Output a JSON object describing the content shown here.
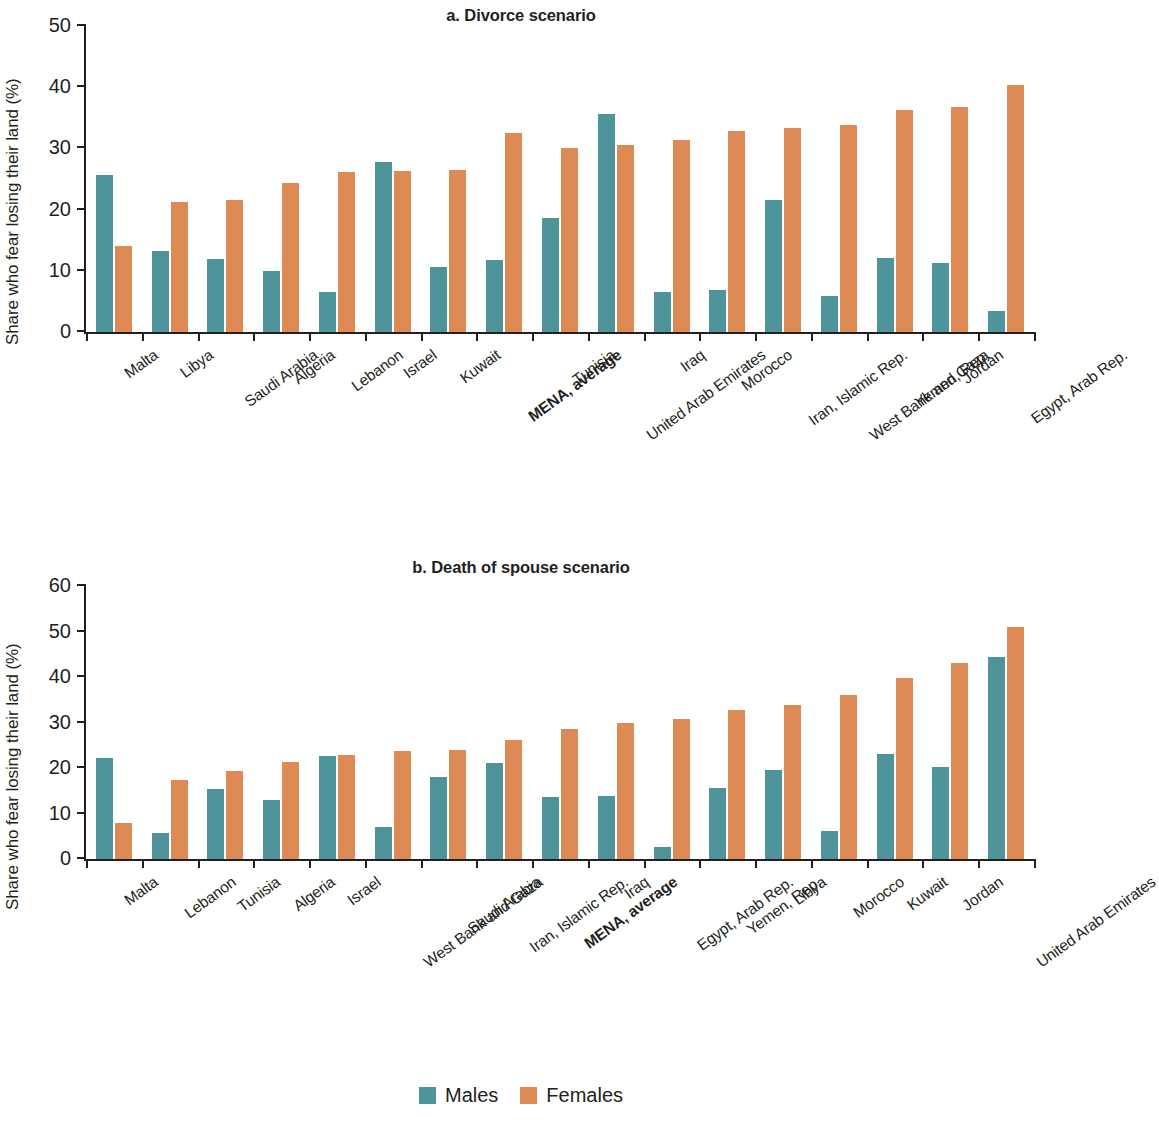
{
  "figure": {
    "legend": {
      "items": [
        {
          "label": "Males",
          "color": "#4f949b",
          "key": "males"
        },
        {
          "label": "Females",
          "color": "#dd8a55",
          "key": "females"
        }
      ]
    }
  },
  "chart_data": [
    {
      "type": "bar",
      "panel": "a",
      "title": "a. Divorce scenario",
      "xlabel": "",
      "ylabel": "Share who fear losing their land (%)",
      "ylim": [
        0,
        50
      ],
      "yticks": [
        0,
        10,
        20,
        30,
        40,
        50
      ],
      "grid": false,
      "legend_position": "bottom-center",
      "highlight_category": "MENA, average",
      "categories": [
        "Malta",
        "Libya",
        "Saudi Arabia",
        "Algeria",
        "Lebanon",
        "Israel",
        "Kuwait",
        "MENA, average",
        "Tunisia",
        "United Arab Emirates",
        "Iraq",
        "Morocco",
        "Iran, Islamic Rep.",
        "West Bank and Gaza",
        "Yemen, Rep.",
        "Jordan",
        "Egypt, Arab Rep."
      ],
      "series": [
        {
          "name": "Males",
          "color": "#4f949b",
          "values": [
            25.6,
            13.2,
            11.9,
            9.9,
            6.5,
            27.8,
            10.6,
            11.8,
            18.6,
            35.6,
            6.5,
            6.8,
            21.5,
            5.9,
            12.1,
            11.2,
            3.4
          ]
        },
        {
          "name": "Females",
          "color": "#dd8a55",
          "values": [
            14.1,
            21.2,
            21.5,
            24.3,
            26.1,
            26.3,
            26.4,
            32.6,
            30.1,
            30.5,
            31.4,
            32.9,
            33.4,
            33.8,
            36.3,
            36.7,
            40.3
          ]
        }
      ]
    },
    {
      "type": "bar",
      "panel": "b",
      "title": "b. Death of spouse scenario",
      "xlabel": "",
      "ylabel": "Share who fear losing their land (%)",
      "ylim": [
        0,
        60
      ],
      "yticks": [
        0,
        10,
        20,
        30,
        40,
        50,
        60
      ],
      "grid": false,
      "legend_position": "bottom-center",
      "highlight_category": "MENA, average",
      "categories": [
        "Malta",
        "Lebanon",
        "Tunisia",
        "Algeria",
        "Israel",
        "West Bank and Gaza",
        "Saudi Arabia",
        "Iran, Islamic Rep.",
        "MENA, average",
        "Iraq",
        "Egypt, Arab Rep.",
        "Yemen, Rep.",
        "Libya",
        "Morocco",
        "Kuwait",
        "Jordan",
        "United Arab Emirates"
      ],
      "series": [
        {
          "name": "Males",
          "color": "#4f949b",
          "values": [
            22.3,
            5.7,
            15.3,
            12.9,
            22.7,
            7.0,
            18.1,
            21.1,
            13.6,
            13.9,
            2.6,
            15.5,
            19.6,
            6.2,
            23.1,
            20.3,
            44.4
          ]
        },
        {
          "name": "Females",
          "color": "#dd8a55",
          "values": [
            7.9,
            17.3,
            19.4,
            21.3,
            22.8,
            23.7,
            23.9,
            26.1,
            28.5,
            30.0,
            30.7,
            32.8,
            33.9,
            36.0,
            39.8,
            43.0,
            51.0
          ]
        }
      ]
    }
  ]
}
